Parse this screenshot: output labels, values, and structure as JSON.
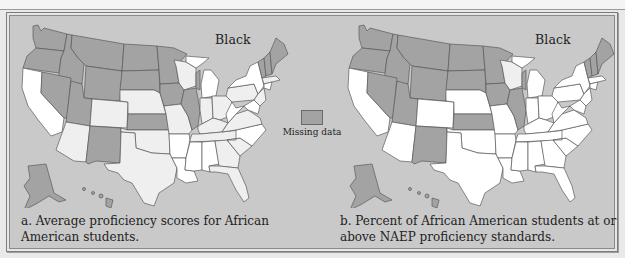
{
  "figure": {
    "panels": [
      {
        "id": "a",
        "group_label": "Black",
        "caption": "a. Average proficiency scores for African American students."
      },
      {
        "id": "b",
        "group_label": "Black",
        "caption": "b. Percent of African American students at or above NAEP proficiency standards."
      }
    ],
    "legend": {
      "items": [
        {
          "label": "Missing data",
          "color": "#a3a3a3"
        }
      ]
    },
    "colors": {
      "missing": "#a3a3a3",
      "light": "#efefef",
      "white": "#ffffff",
      "background": "#c9c9c9",
      "border": "#6a6a6a"
    }
  }
}
